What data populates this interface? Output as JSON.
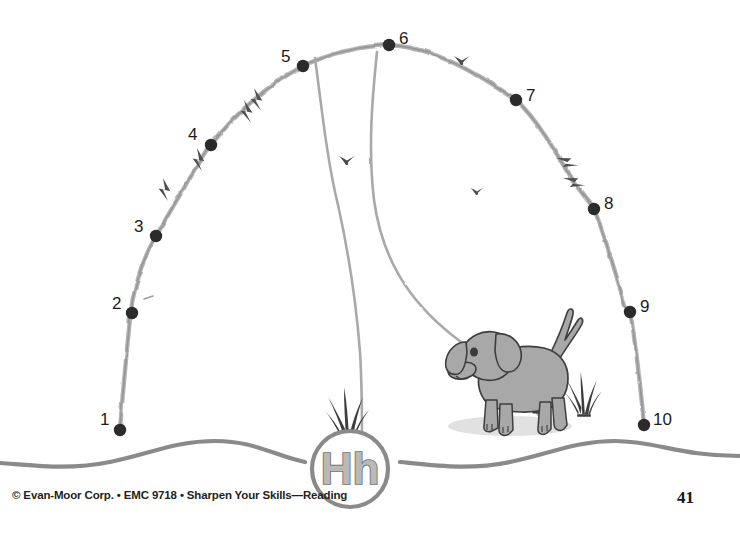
{
  "worksheet": {
    "title": "Connect the Dots — Hh",
    "letter_label": "Hh",
    "background_color": "#ffffff",
    "ink_color": "#9a9a9a",
    "dot_color": "#2b2b2b",
    "number_color": "#1c1c1c"
  },
  "footer": {
    "copyright": "© Evan-Moor Corp. • EMC 9718 • Sharpen Your Skills—Reading",
    "page_number": "41"
  },
  "dots": [
    {
      "label": "1",
      "dot_x": 120,
      "dot_y": 430,
      "num_x": 100,
      "num_y": 411
    },
    {
      "label": "2",
      "dot_x": 132,
      "dot_y": 313,
      "num_x": 112,
      "num_y": 295
    },
    {
      "label": "3",
      "dot_x": 156,
      "dot_y": 236,
      "num_x": 134,
      "num_y": 218
    },
    {
      "label": "4",
      "dot_x": 211,
      "dot_y": 145,
      "num_x": 188,
      "num_y": 126
    },
    {
      "label": "5",
      "dot_x": 303,
      "dot_y": 66,
      "num_x": 281,
      "num_y": 48
    },
    {
      "label": "6",
      "dot_x": 389,
      "dot_y": 45,
      "num_x": 399,
      "num_y": 30
    },
    {
      "label": "7",
      "dot_x": 516,
      "dot_y": 100,
      "num_x": 526,
      "num_y": 87
    },
    {
      "label": "8",
      "dot_x": 594,
      "dot_y": 209,
      "num_x": 604,
      "num_y": 195
    },
    {
      "label": "9",
      "dot_x": 630,
      "dot_y": 312,
      "num_x": 640,
      "num_y": 298
    },
    {
      "label": "10",
      "dot_x": 644,
      "dot_y": 425,
      "num_x": 653,
      "num_y": 411
    }
  ],
  "scene": {
    "birds": [
      {
        "x": 462,
        "y": 60,
        "size": 17
      },
      {
        "x": 347,
        "y": 160,
        "size": 17
      },
      {
        "x": 477,
        "y": 191,
        "size": 14
      }
    ],
    "grass_tufts": [
      {
        "name": "grass-tuft-center",
        "x": 328,
        "y": 385,
        "scale": 1.0
      },
      {
        "name": "grass-tuft-dog-right",
        "x": 567,
        "y": 370,
        "scale": 0.85
      },
      {
        "name": "grass-tuft-dog-left",
        "x": 524,
        "y": 375,
        "scale": 0.7
      }
    ],
    "dog": {
      "name": "dog-illustration",
      "x": 452,
      "y": 320,
      "body_color": "#a8a8a8",
      "outline_color": "#3d3d3d",
      "shadow_color": "#dcdcdc"
    },
    "fur_marks": [
      {
        "x": 163,
        "y": 178,
        "rot": 38
      },
      {
        "x": 197,
        "y": 148,
        "rot": 38
      },
      {
        "x": 244,
        "y": 100,
        "rot": 33
      },
      {
        "x": 254,
        "y": 88,
        "rot": 33
      },
      {
        "x": 556,
        "y": 158,
        "rot": -22
      },
      {
        "x": 563,
        "y": 178,
        "rot": -22
      }
    ]
  }
}
